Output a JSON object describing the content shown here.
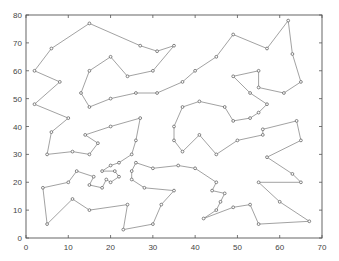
{
  "chart_data": {
    "type": "line",
    "subtype": "closed-tour-path",
    "title": "",
    "xlabel": "",
    "ylabel": "",
    "xlim": [
      0,
      70
    ],
    "ylim": [
      0,
      80
    ],
    "xticks": [
      0,
      10,
      20,
      30,
      40,
      50,
      60,
      70
    ],
    "yticks": [
      0,
      10,
      20,
      30,
      40,
      50,
      60,
      70,
      80
    ],
    "grid": false,
    "legend": null,
    "closed": true,
    "colors": {
      "line": "#8a8a8a",
      "marker": "#666666",
      "axis": "#555555"
    },
    "series": [
      {
        "name": "tour",
        "points": [
          [
            45,
            10
          ],
          [
            46,
            13
          ],
          [
            47,
            16
          ],
          [
            44,
            17
          ],
          [
            45,
            20
          ],
          [
            40,
            25
          ],
          [
            36,
            26
          ],
          [
            30,
            25
          ],
          [
            26,
            27
          ],
          [
            25,
            24
          ],
          [
            25,
            21
          ],
          [
            28,
            18
          ],
          [
            35,
            17
          ],
          [
            32,
            12
          ],
          [
            30,
            5
          ],
          [
            23,
            3
          ],
          [
            24,
            12
          ],
          [
            15,
            10
          ],
          [
            11,
            14
          ],
          [
            5,
            5
          ],
          [
            4,
            18
          ],
          [
            10,
            20
          ],
          [
            12,
            24
          ],
          [
            16,
            22
          ],
          [
            15,
            19
          ],
          [
            18,
            18
          ],
          [
            19,
            21
          ],
          [
            20,
            20
          ],
          [
            22,
            22
          ],
          [
            21,
            24
          ],
          [
            18,
            24
          ],
          [
            20,
            26
          ],
          [
            22,
            27
          ],
          [
            25,
            30
          ],
          [
            26,
            35
          ],
          [
            27,
            43
          ],
          [
            20,
            40
          ],
          [
            14,
            37
          ],
          [
            17,
            34
          ],
          [
            15,
            30
          ],
          [
            11,
            31
          ],
          [
            5,
            30
          ],
          [
            6,
            38
          ],
          [
            10,
            43
          ],
          [
            2,
            48
          ],
          [
            8,
            56
          ],
          [
            2,
            60
          ],
          [
            6,
            68
          ],
          [
            15,
            77
          ],
          [
            27,
            69
          ],
          [
            31,
            67
          ],
          [
            35,
            69
          ],
          [
            30,
            60
          ],
          [
            24,
            58
          ],
          [
            20,
            65
          ],
          [
            15,
            60
          ],
          [
            13,
            52
          ],
          [
            15,
            47
          ],
          [
            20,
            50
          ],
          [
            26,
            52
          ],
          [
            31,
            52
          ],
          [
            37,
            56
          ],
          [
            40,
            60
          ],
          [
            45,
            65
          ],
          [
            49,
            73
          ],
          [
            57,
            68
          ],
          [
            62,
            78
          ],
          [
            63,
            66
          ],
          [
            65,
            56
          ],
          [
            61,
            52
          ],
          [
            55,
            54
          ],
          [
            55,
            60
          ],
          [
            49,
            58
          ],
          [
            53,
            52
          ],
          [
            57,
            48
          ],
          [
            55,
            45
          ],
          [
            53,
            43
          ],
          [
            49,
            42
          ],
          [
            47,
            47
          ],
          [
            41,
            49
          ],
          [
            37,
            47
          ],
          [
            35,
            40
          ],
          [
            35,
            35
          ],
          [
            37,
            31
          ],
          [
            41,
            37
          ],
          [
            45,
            30
          ],
          [
            50,
            35
          ],
          [
            56,
            37
          ],
          [
            56,
            39
          ],
          [
            64,
            42
          ],
          [
            65,
            35
          ],
          [
            57,
            29
          ],
          [
            63,
            23
          ],
          [
            65,
            20
          ],
          [
            55,
            20
          ],
          [
            60,
            13
          ],
          [
            67,
            6
          ],
          [
            55,
            5
          ],
          [
            53,
            12
          ],
          [
            49,
            11
          ],
          [
            42,
            7
          ]
        ]
      }
    ]
  },
  "layout": {
    "plot_left": 26,
    "plot_right": 322,
    "plot_top": 15,
    "plot_bottom": 238
  }
}
